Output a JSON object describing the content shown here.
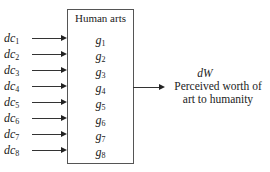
{
  "diagram": {
    "box": {
      "title": "Human arts",
      "items": [
        {
          "base": "g",
          "sub": "1"
        },
        {
          "base": "g",
          "sub": "2"
        },
        {
          "base": "g",
          "sub": "3"
        },
        {
          "base": "g",
          "sub": "4"
        },
        {
          "base": "g",
          "sub": "5"
        },
        {
          "base": "g",
          "sub": "6"
        },
        {
          "base": "g",
          "sub": "7"
        },
        {
          "base": "g",
          "sub": "8"
        }
      ]
    },
    "inputs": [
      {
        "base": "dc",
        "sub": "1"
      },
      {
        "base": "dc",
        "sub": "2"
      },
      {
        "base": "dc",
        "sub": "3"
      },
      {
        "base": "dc",
        "sub": "4"
      },
      {
        "base": "dc",
        "sub": "5"
      },
      {
        "base": "dc",
        "sub": "6"
      },
      {
        "base": "dc",
        "sub": "7"
      },
      {
        "base": "dc",
        "sub": "8"
      }
    ],
    "output": {
      "variable": "dW",
      "line1": "Perceived worth of",
      "line2": "art to humanity"
    },
    "colors": {
      "line": "#333333",
      "text": "#222222",
      "background": "#ffffff"
    }
  }
}
